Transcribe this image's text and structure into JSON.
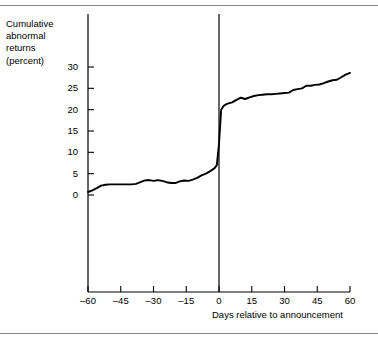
{
  "figure": {
    "y_axis_label": "Cumulative\nabnormal\nreturns\n(percent)",
    "x_axis_label": "Days relative to announcement",
    "line_color": "#000000",
    "axis_color": "#000000",
    "rule_color": "#8a8a8a"
  },
  "chart_data": {
    "type": "line",
    "title": "",
    "subtitle": "",
    "xlabel": "Days relative to announcement",
    "ylabel": "Cumulative abnormal returns (percent)",
    "xlim": [
      -60,
      60
    ],
    "ylim": [
      0,
      32
    ],
    "xticks": [
      -60,
      -45,
      -30,
      -15,
      0,
      15,
      30,
      45,
      60
    ],
    "xtick_labels": [
      "–60",
      "–45",
      "–30",
      "–15",
      "0",
      "15",
      "30",
      "45",
      "60"
    ],
    "yticks": [
      0,
      5,
      10,
      15,
      20,
      25,
      30
    ],
    "ytick_labels": [
      "0",
      "5",
      "10",
      "15",
      "20",
      "25",
      "30"
    ],
    "grid": false,
    "legend": "none",
    "annotations": [
      {
        "type": "vline",
        "x": 0,
        "label": "announcement day"
      }
    ],
    "series": [
      {
        "name": "Cumulative abnormal returns",
        "x": [
          -60,
          -58,
          -56,
          -54,
          -52,
          -50,
          -48,
          -46,
          -44,
          -42,
          -40,
          -38,
          -36,
          -34,
          -32,
          -30,
          -28,
          -26,
          -24,
          -22,
          -20,
          -18,
          -16,
          -14,
          -12,
          -10,
          -8,
          -6,
          -4,
          -2,
          -1,
          0,
          1,
          2,
          3,
          4,
          6,
          8,
          10,
          12,
          14,
          16,
          18,
          20,
          22,
          24,
          26,
          28,
          30,
          32,
          34,
          36,
          38,
          40,
          42,
          44,
          46,
          48,
          50,
          52,
          54,
          56,
          58,
          60
        ],
        "values": [
          0.7,
          1.1,
          1.6,
          2.2,
          2.4,
          2.5,
          2.5,
          2.5,
          2.5,
          2.5,
          2.5,
          2.6,
          3.0,
          3.4,
          3.5,
          3.3,
          3.5,
          3.3,
          3.0,
          2.8,
          2.8,
          3.2,
          3.4,
          3.3,
          3.6,
          4.0,
          4.6,
          5.0,
          5.6,
          6.3,
          7.0,
          12.0,
          20.0,
          20.8,
          21.2,
          21.4,
          21.7,
          22.3,
          22.8,
          22.5,
          22.9,
          23.2,
          23.4,
          23.5,
          23.6,
          23.6,
          23.7,
          23.8,
          23.9,
          24.0,
          24.6,
          24.8,
          25.0,
          25.6,
          25.6,
          25.8,
          25.9,
          26.2,
          26.6,
          26.9,
          27.0,
          27.6,
          28.2,
          28.6
        ]
      }
    ]
  }
}
